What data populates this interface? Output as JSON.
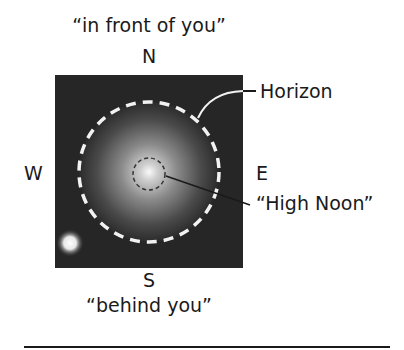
{
  "diagram": {
    "top_caption": "“in front of you”",
    "bottom_caption": "“behind you”",
    "directions": {
      "north": "N",
      "south": "S",
      "east": "E",
      "west": "W"
    },
    "callouts": {
      "horizon": "Horizon",
      "zenith": "“High Noon”"
    },
    "colors": {
      "sky_background": "#2a2a2a",
      "horizon_dash": "#f2f2f2",
      "zenith_dash": "#333333",
      "text": "#1a1a1a",
      "sun_glow": "#ffffff"
    },
    "elements": {
      "sky_box": {
        "x": 55,
        "y": 75,
        "width": 188,
        "height": 193
      },
      "horizon_circle": {
        "cx": 149,
        "cy": 172,
        "r": 70
      },
      "zenith_circle": {
        "cx": 149,
        "cy": 174,
        "r": 16
      },
      "sun": {
        "cx": 70,
        "cy": 243,
        "r": 13
      }
    }
  }
}
